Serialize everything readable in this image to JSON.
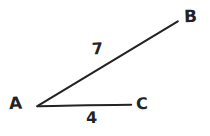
{
  "diagram": {
    "type": "angle-diagram",
    "background_color": "#ffffff",
    "stroke_color": "#232323",
    "vertices": [
      {
        "id": "A",
        "label": "A",
        "x": 37,
        "y": 106
      },
      {
        "id": "B",
        "label": "B",
        "x": 178,
        "y": 21
      },
      {
        "id": "C",
        "label": "C",
        "x": 131,
        "y": 105
      }
    ],
    "segments": [
      {
        "id": "AB",
        "from": "A",
        "to": "B",
        "length_label": "7"
      },
      {
        "id": "AC",
        "from": "A",
        "to": "C",
        "length_label": "4"
      }
    ],
    "labels": {
      "vertex_a": "A",
      "vertex_b": "B",
      "vertex_c": "C",
      "length_ab": "7",
      "length_ac": "4"
    }
  }
}
